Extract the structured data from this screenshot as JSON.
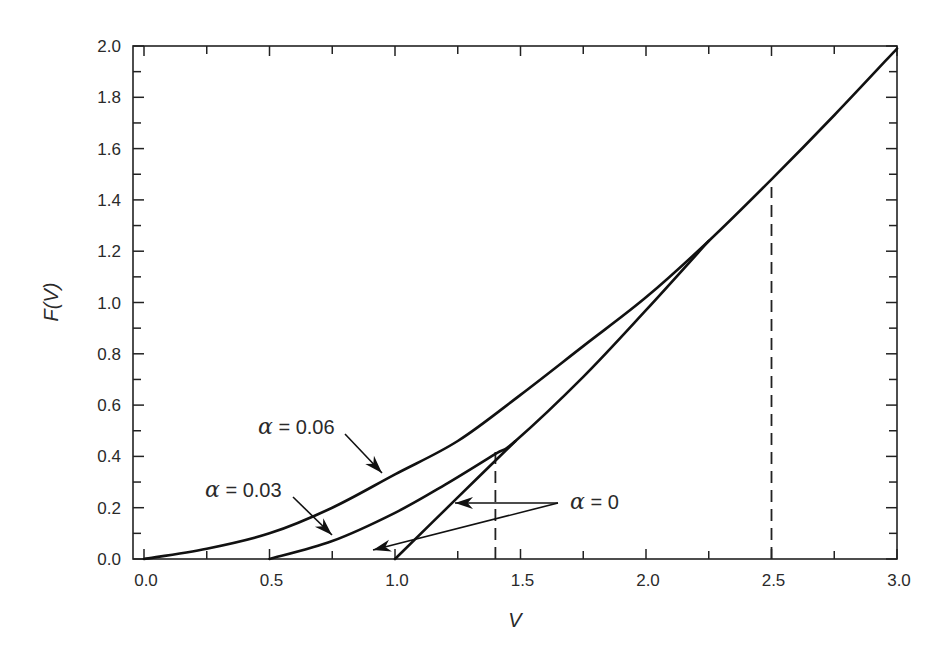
{
  "chart_data": {
    "type": "line",
    "title": "",
    "xlabel": "V",
    "ylabel": "F(V)",
    "xlim": [
      -0.044,
      3.0
    ],
    "ylim": [
      0.0,
      2.0
    ],
    "grid": false,
    "legend": "none (curves labeled by inline arrow annotations)",
    "x_ticks": [
      "0.0",
      "0.5",
      "1.0",
      "1.5",
      "2.0",
      "2.5",
      "3.0"
    ],
    "x_tick_values": [
      0.0,
      0.5,
      1.0,
      1.5,
      2.0,
      2.5,
      3.0
    ],
    "y_ticks": [
      "0.0",
      "0.2",
      "0.4",
      "0.6",
      "0.8",
      "1.0",
      "1.2",
      "1.4",
      "1.6",
      "1.8",
      "2.0"
    ],
    "y_tick_values": [
      0.0,
      0.2,
      0.4,
      0.6,
      0.8,
      1.0,
      1.2,
      1.4,
      1.6,
      1.8,
      2.0
    ],
    "series": [
      {
        "name": "α = 0.06",
        "x": [
          0.0,
          0.25,
          0.5,
          0.75,
          1.0,
          1.25,
          1.5,
          1.75,
          2.0,
          2.25,
          2.5,
          2.75,
          3.0
        ],
        "y": [
          0.0,
          0.04,
          0.1,
          0.2,
          0.33,
          0.46,
          0.64,
          0.83,
          1.02,
          1.24,
          1.48,
          1.73,
          1.99
        ]
      },
      {
        "name": "α = 0.03",
        "x": [
          0.5,
          0.75,
          1.0,
          1.2,
          1.4,
          1.48,
          1.75,
          2.0,
          2.25
        ],
        "y": [
          0.0,
          0.07,
          0.18,
          0.29,
          0.41,
          0.46,
          0.71,
          0.97,
          1.24
        ]
      },
      {
        "name": "α = 0",
        "x": [
          1.0,
          1.25,
          1.48
        ],
        "y": [
          0.0,
          0.24,
          0.46
        ]
      }
    ],
    "reference_lines": [
      {
        "type": "vertical",
        "style": "dashed",
        "x": 1.4,
        "y_from": 0.0,
        "y_to": 0.43
      },
      {
        "type": "vertical",
        "style": "dashed",
        "x": 2.5,
        "y_from": 0.0,
        "y_to": 1.45
      }
    ],
    "annotations": [
      {
        "text": "α = 0.06",
        "label_at": [
          0.55,
          0.48
        ],
        "arrow_to": [
          0.95,
          0.33
        ]
      },
      {
        "text": "α = 0.03",
        "label_at": [
          0.3,
          0.26
        ],
        "arrow_to": [
          0.75,
          0.09
        ]
      },
      {
        "text": "α = 0",
        "label_at": [
          1.65,
          0.22
        ],
        "arrows_to": [
          [
            1.24,
            0.22
          ],
          [
            0.92,
            0.03
          ]
        ]
      }
    ]
  },
  "labels": {
    "xlabel": "V",
    "ylabel": "F(V)",
    "annot_006_alpha": "α",
    "annot_006_value": " = 0.06",
    "annot_003_alpha": "α",
    "annot_003_value": " = 0.03",
    "annot_0_alpha": "α",
    "annot_0_value": " = 0"
  }
}
